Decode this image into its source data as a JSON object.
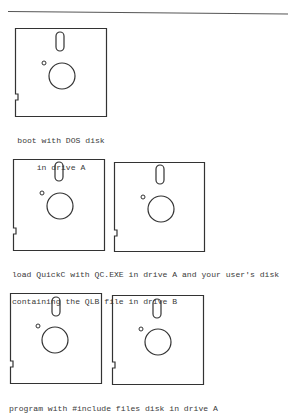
{
  "page": {
    "divider": true,
    "figures": [
      {
        "disks": [
          {
            "label": "DOS disk",
            "drive": "A",
            "x": 15,
            "y": 28,
            "w": 92,
            "h": 89
          }
        ],
        "caption_lines": [
          "boot with DOS disk",
          "in drive A"
        ]
      },
      {
        "disks": [
          {
            "label": "QuickC QC.EXE disk",
            "drive": "A",
            "x": 13,
            "y": 159,
            "w": 92,
            "h": 92
          },
          {
            "label": "user's disk with QLB file",
            "drive": "B",
            "x": 114,
            "y": 162,
            "w": 91,
            "h": 90
          }
        ],
        "caption_lines": [
          "load QuickC with QC.EXE in drive A and your user's disk",
          "containing the QLB file in drive B"
        ]
      },
      {
        "disks": [
          {
            "label": "#include files disk",
            "drive": "A",
            "x": 10,
            "y": 293,
            "w": 92,
            "h": 91
          },
          {
            "label": "disk",
            "drive": "B",
            "x": 112,
            "y": 295,
            "w": 92,
            "h": 90
          }
        ],
        "caption_lines": [
          "program with #include files disk in drive A"
        ]
      }
    ],
    "colors": {
      "ink": "#333333",
      "paper": "#ffffff"
    }
  }
}
